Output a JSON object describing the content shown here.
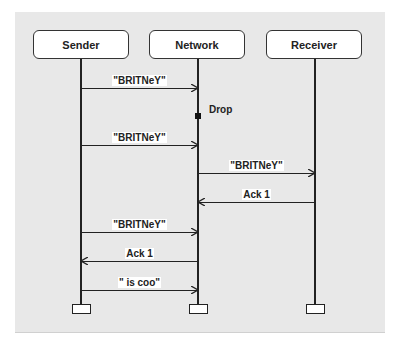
{
  "diagram": {
    "type": "sequence",
    "actors": [
      {
        "id": "sender",
        "label": "Sender"
      },
      {
        "id": "network",
        "label": "Network"
      },
      {
        "id": "receiver",
        "label": "Receiver"
      }
    ],
    "messages": [
      {
        "from": "Sender",
        "to": "Network",
        "label": "\"BRITNeY\""
      },
      {
        "from": "Sender",
        "to": "Network",
        "label": "\"BRITNeY\""
      },
      {
        "from": "Network",
        "to": "Receiver",
        "label": "\"BRITNeY\""
      },
      {
        "from": "Receiver",
        "to": "Network",
        "label": "Ack 1"
      },
      {
        "from": "Sender",
        "to": "Network",
        "label": "\"BRITNeY\""
      },
      {
        "from": "Network",
        "to": "Sender",
        "label": "Ack 1"
      },
      {
        "from": "Sender",
        "to": "Network",
        "label": "\" is coo\""
      }
    ],
    "events": [
      {
        "on": "Network",
        "label": "Drop"
      }
    ],
    "colors": {
      "background": "#e8e8e8",
      "line": "#222222",
      "box": "#ffffff"
    }
  }
}
